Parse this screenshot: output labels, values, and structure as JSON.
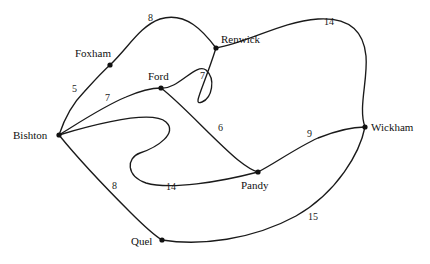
{
  "figure": {
    "type": "graph-diagram",
    "title": "",
    "background_color": "#ffffff",
    "stroke_color": "#1a1a1a",
    "text_color": "#111111"
  },
  "nodes": [
    {
      "id": "foxham",
      "label": "Foxham",
      "x": 110,
      "y": 65,
      "label_x": 75,
      "label_y": 57
    },
    {
      "id": "ford",
      "label": "Ford",
      "x": 161,
      "y": 88,
      "label_x": 148,
      "label_y": 80
    },
    {
      "id": "renwick",
      "label": "Renwick",
      "x": 216,
      "y": 48,
      "label_x": 221,
      "label_y": 43
    },
    {
      "id": "bishton",
      "label": "Bishton",
      "x": 59,
      "y": 135,
      "label_x": 13,
      "label_y": 139
    },
    {
      "id": "pandy",
      "label": "Pandy",
      "x": 258,
      "y": 172,
      "label_x": 241,
      "label_y": 189
    },
    {
      "id": "wickham",
      "label": "Wickham",
      "x": 365,
      "y": 127,
      "label_x": 371,
      "label_y": 131
    },
    {
      "id": "quel",
      "label": "Quel",
      "x": 162,
      "y": 240,
      "label_x": 131,
      "label_y": 245
    }
  ],
  "edges": [
    {
      "id": "foxham-renwick",
      "from": "foxham",
      "to": "renwick",
      "weight": "8",
      "label_x": 148,
      "label_y": 21
    },
    {
      "id": "renwick-wickham",
      "from": "renwick",
      "to": "wickham",
      "weight": "14",
      "label_x": 324,
      "label_y": 25
    },
    {
      "id": "ford-renwick",
      "from": "ford",
      "to": "renwick",
      "weight": "7",
      "label_x": 200,
      "label_y": 79
    },
    {
      "id": "bishton-foxham",
      "from": "bishton",
      "to": "foxham",
      "weight": "5",
      "label_x": 72,
      "label_y": 92
    },
    {
      "id": "bishton-ford",
      "from": "bishton",
      "to": "ford",
      "weight": "7",
      "label_x": 105,
      "label_y": 101
    },
    {
      "id": "ford-pandy",
      "from": "ford",
      "to": "pandy",
      "weight": "6",
      "label_x": 218,
      "label_y": 131
    },
    {
      "id": "pandy-wickham",
      "from": "pandy",
      "to": "wickham",
      "weight": "9",
      "label_x": 307,
      "label_y": 137
    },
    {
      "id": "bishton-quel",
      "from": "bishton",
      "to": "quel",
      "weight": "8",
      "label_x": 112,
      "label_y": 189
    },
    {
      "id": "bishton-pandy",
      "from": "bishton",
      "to": "pandy",
      "weight": "14",
      "label_x": 166,
      "label_y": 190
    },
    {
      "id": "quel-wickham",
      "from": "quel",
      "to": "wickham",
      "weight": "15",
      "label_x": 308,
      "label_y": 220
    }
  ],
  "chart_data": {
    "type": "graph",
    "title": "",
    "node_names": [
      "Foxham",
      "Ford",
      "Renwick",
      "Bishton",
      "Pandy",
      "Wickham",
      "Quel"
    ],
    "edge_list": [
      {
        "source": "Foxham",
        "target": "Renwick",
        "weight": 8
      },
      {
        "source": "Renwick",
        "target": "Wickham",
        "weight": 14
      },
      {
        "source": "Ford",
        "target": "Renwick",
        "weight": 7
      },
      {
        "source": "Bishton",
        "target": "Foxham",
        "weight": 5
      },
      {
        "source": "Bishton",
        "target": "Ford",
        "weight": 7
      },
      {
        "source": "Ford",
        "target": "Pandy",
        "weight": 6
      },
      {
        "source": "Pandy",
        "target": "Wickham",
        "weight": 9
      },
      {
        "source": "Bishton",
        "target": "Quel",
        "weight": 8
      },
      {
        "source": "Bishton",
        "target": "Pandy",
        "weight": 14
      },
      {
        "source": "Quel",
        "target": "Wickham",
        "weight": 15
      }
    ],
    "weights": [
      8,
      14,
      7,
      5,
      7,
      6,
      9,
      8,
      14,
      15
    ],
    "directed": false,
    "grid": false,
    "legend": "none"
  },
  "paths": {
    "foxham_renwick": "M 110 65 C 128 48 140 26 160 19 C 186 11 204 32 216 48",
    "renwick_wickham": "M 216 48 C 250 42 280 22 318 19 C 352 17 364 34 366 56 C 368 80 358 108 365 127",
    "ford_renwick": "M 161 88 C 178 90 196 62 206 70 C 216 79 212 98 202 102 C 192 106 202 92 216 48",
    "bishton_foxham": "M 59 135 C 64 120 72 104 84 92 C 94 81 102 72 110 65",
    "bishton_ford": "M 59 135 C 80 122 104 106 126 97 C 142 90 154 88 161 88",
    "ford_pandy": "M 161 88 C 182 104 214 140 238 160 C 248 168 254 171 258 172",
    "pandy_wickham": "M 258 172 C 274 164 296 148 318 138 C 338 130 356 127 365 127",
    "bishton_quel": "M 59 135 C 76 156 104 186 130 212 C 146 228 157 237 162 240",
    "bishton_pandy": "M 59 135 C 96 124 152 110 166 122 C 178 133 158 147 140 153 C 126 158 126 176 146 183 C 170 190 220 182 258 172",
    "quel_wickham": "M 162 240 C 200 246 252 240 296 216 C 338 192 360 152 365 127"
  }
}
